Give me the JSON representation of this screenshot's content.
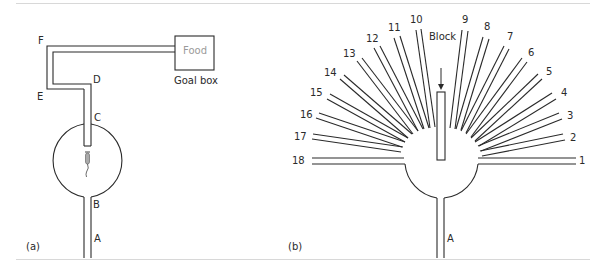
{
  "panel_a": {
    "caption": "(a)",
    "labels": {
      "A": "A",
      "B": "B",
      "C": "C",
      "D": "D",
      "E": "E",
      "F": "F"
    },
    "goal_box": {
      "content": "Food",
      "caption": "Goal box"
    }
  },
  "panel_b": {
    "caption": "(b)",
    "block_label": "Block",
    "stem_label": "A",
    "arms": [
      "1",
      "2",
      "3",
      "4",
      "5",
      "6",
      "7",
      "8",
      "9",
      "10",
      "11",
      "12",
      "13",
      "14",
      "15",
      "16",
      "17",
      "18"
    ]
  }
}
